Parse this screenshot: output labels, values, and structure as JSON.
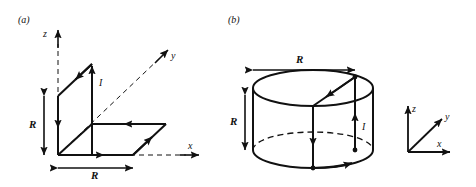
{
  "figure": {
    "panels": [
      {
        "id": "panel-a",
        "tag": "(a)",
        "description": "square current loop bent over the x-z and x-y planes",
        "axes": {
          "z": "z",
          "y": "y",
          "x": "x"
        },
        "current_label": "I",
        "dimensions": [
          {
            "name": "height",
            "label": "R"
          },
          {
            "name": "width",
            "label": "R"
          }
        ]
      },
      {
        "id": "panel-b",
        "tag": "(b)",
        "description": "current path on a cylinder of radius R and height R",
        "current_label": "I",
        "dimensions": [
          {
            "name": "radius",
            "label": "R"
          },
          {
            "name": "height",
            "label": "R"
          }
        ],
        "axis_triad": {
          "z": "z",
          "y": "y",
          "x": "x"
        }
      }
    ],
    "colors": {
      "stroke": "#111111",
      "background": "#ffffff"
    }
  }
}
